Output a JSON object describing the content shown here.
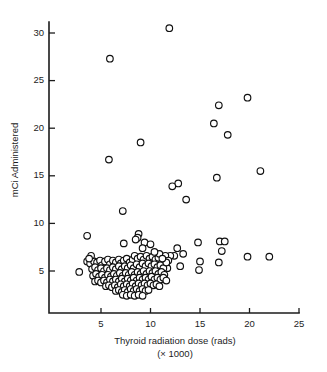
{
  "figure": {
    "background_color": "#ffffff",
    "ink_color": "#1c1c1c",
    "marker": {
      "shape": "open-circle",
      "fill_color": "#ffffff",
      "stroke_color": "#101010",
      "radius_px": 3.3
    }
  },
  "chart_data": {
    "type": "scatter",
    "title": "",
    "subtitle": "",
    "xlabel": "Thyroid radiation dose (rads)",
    "xlabel_line2": "(× 1000)",
    "ylabel": "mCi Administered",
    "xlim": [
      0,
      25
    ],
    "ylim": [
      0,
      32
    ],
    "xticks": [
      5,
      10,
      15,
      20,
      25
    ],
    "xtick_labels": [
      "5",
      "10",
      "15",
      "20",
      "25"
    ],
    "yticks": [
      5,
      10,
      15,
      20,
      25,
      30
    ],
    "ytick_labels": [
      "5",
      "10",
      "15",
      "20",
      "25",
      "30"
    ],
    "grid": false,
    "legend": false,
    "legend_position": "none",
    "series": [
      {
        "name": "patients",
        "marker": "open-circle",
        "points": [
          [
            11.9,
            30.5
          ],
          [
            5.9,
            27.3
          ],
          [
            19.8,
            23.2
          ],
          [
            16.9,
            22.4
          ],
          [
            16.4,
            20.5
          ],
          [
            17.8,
            19.3
          ],
          [
            9.0,
            18.5
          ],
          [
            5.8,
            16.7
          ],
          [
            21.1,
            15.5
          ],
          [
            16.7,
            14.8
          ],
          [
            12.8,
            14.2
          ],
          [
            12.2,
            13.9
          ],
          [
            13.6,
            12.5
          ],
          [
            7.2,
            11.3
          ],
          [
            3.6,
            8.7
          ],
          [
            8.8,
            8.9
          ],
          [
            8.7,
            8.5
          ],
          [
            8.5,
            8.3
          ],
          [
            9.4,
            8.0
          ],
          [
            14.8,
            8.0
          ],
          [
            17.0,
            8.1
          ],
          [
            17.5,
            8.1
          ],
          [
            7.3,
            7.9
          ],
          [
            10.0,
            7.8
          ],
          [
            9.2,
            7.4
          ],
          [
            12.7,
            7.4
          ],
          [
            17.2,
            7.1
          ],
          [
            13.3,
            6.8
          ],
          [
            12.4,
            6.6
          ],
          [
            12.0,
            6.6
          ],
          [
            11.5,
            6.6
          ],
          [
            19.8,
            6.5
          ],
          [
            22.0,
            6.5
          ],
          [
            15.0,
            6.0
          ],
          [
            16.9,
            5.9
          ],
          [
            13.0,
            5.5
          ],
          [
            14.9,
            5.1
          ],
          [
            11.7,
            5.3
          ],
          [
            2.8,
            4.9
          ],
          [
            3.6,
            6.0
          ],
          [
            3.9,
            5.8
          ],
          [
            4.3,
            6.0
          ],
          [
            4.6,
            5.9
          ],
          [
            4.9,
            6.1
          ],
          [
            5.1,
            5.6
          ],
          [
            5.4,
            6.0
          ],
          [
            5.7,
            6.2
          ],
          [
            5.9,
            5.7
          ],
          [
            6.2,
            6.1
          ],
          [
            6.5,
            5.9
          ],
          [
            6.8,
            6.2
          ],
          [
            7.0,
            5.8
          ],
          [
            7.3,
            6.1
          ],
          [
            7.6,
            6.3
          ],
          [
            7.9,
            5.9
          ],
          [
            8.2,
            6.2
          ],
          [
            8.4,
            6.6
          ],
          [
            8.7,
            6.3
          ],
          [
            9.0,
            6.5
          ],
          [
            9.3,
            6.2
          ],
          [
            9.6,
            6.6
          ],
          [
            9.9,
            6.3
          ],
          [
            10.2,
            6.5
          ],
          [
            10.5,
            6.2
          ],
          [
            10.8,
            6.4
          ],
          [
            4.1,
            5.2
          ],
          [
            4.4,
            5.4
          ],
          [
            4.7,
            5.1
          ],
          [
            5.0,
            5.3
          ],
          [
            5.3,
            5.0
          ],
          [
            5.6,
            5.3
          ],
          [
            5.9,
            5.1
          ],
          [
            6.2,
            5.4
          ],
          [
            6.5,
            5.2
          ],
          [
            6.8,
            5.5
          ],
          [
            7.1,
            5.2
          ],
          [
            7.4,
            5.5
          ],
          [
            7.7,
            5.3
          ],
          [
            8.0,
            5.6
          ],
          [
            8.3,
            5.3
          ],
          [
            8.6,
            5.7
          ],
          [
            8.9,
            5.4
          ],
          [
            9.2,
            5.8
          ],
          [
            9.5,
            5.5
          ],
          [
            9.8,
            5.8
          ],
          [
            10.1,
            5.5
          ],
          [
            10.4,
            5.7
          ],
          [
            10.7,
            5.4
          ],
          [
            11.0,
            5.6
          ],
          [
            11.3,
            5.3
          ],
          [
            4.2,
            4.5
          ],
          [
            4.5,
            4.7
          ],
          [
            4.8,
            4.4
          ],
          [
            5.1,
            4.6
          ],
          [
            5.4,
            4.3
          ],
          [
            5.7,
            4.6
          ],
          [
            6.0,
            4.4
          ],
          [
            6.3,
            4.7
          ],
          [
            6.6,
            4.5
          ],
          [
            6.9,
            4.8
          ],
          [
            7.2,
            4.5
          ],
          [
            7.5,
            4.8
          ],
          [
            7.8,
            4.6
          ],
          [
            8.1,
            4.9
          ],
          [
            8.4,
            4.6
          ],
          [
            8.7,
            4.9
          ],
          [
            9.0,
            4.7
          ],
          [
            9.3,
            5.0
          ],
          [
            9.6,
            4.7
          ],
          [
            9.9,
            5.0
          ],
          [
            10.2,
            4.8
          ],
          [
            10.5,
            5.0
          ],
          [
            10.8,
            4.7
          ],
          [
            11.1,
            4.9
          ],
          [
            11.4,
            4.6
          ],
          [
            4.4,
            3.9
          ],
          [
            4.7,
            4.0
          ],
          [
            5.0,
            3.8
          ],
          [
            5.3,
            4.0
          ],
          [
            5.6,
            3.8
          ],
          [
            5.9,
            4.1
          ],
          [
            6.2,
            3.9
          ],
          [
            6.5,
            4.1
          ],
          [
            6.8,
            3.9
          ],
          [
            7.1,
            4.2
          ],
          [
            7.4,
            3.9
          ],
          [
            7.7,
            4.2
          ],
          [
            8.0,
            4.0
          ],
          [
            8.3,
            4.3
          ],
          [
            8.6,
            4.0
          ],
          [
            8.9,
            4.3
          ],
          [
            9.2,
            4.1
          ],
          [
            9.5,
            4.3
          ],
          [
            9.8,
            4.1
          ],
          [
            10.1,
            4.4
          ],
          [
            10.4,
            4.1
          ],
          [
            10.7,
            4.3
          ],
          [
            11.0,
            4.1
          ],
          [
            11.3,
            4.3
          ],
          [
            11.6,
            4.0
          ],
          [
            5.5,
            3.4
          ],
          [
            5.8,
            3.5
          ],
          [
            6.1,
            3.3
          ],
          [
            6.4,
            3.5
          ],
          [
            6.7,
            3.3
          ],
          [
            7.0,
            3.6
          ],
          [
            7.3,
            3.4
          ],
          [
            7.6,
            3.6
          ],
          [
            7.9,
            3.4
          ],
          [
            8.2,
            3.7
          ],
          [
            8.5,
            3.4
          ],
          [
            8.8,
            3.7
          ],
          [
            9.1,
            3.5
          ],
          [
            9.4,
            3.7
          ],
          [
            9.7,
            3.5
          ],
          [
            10.0,
            3.7
          ],
          [
            10.3,
            3.5
          ],
          [
            10.6,
            3.6
          ],
          [
            10.9,
            3.4
          ],
          [
            6.5,
            2.9
          ],
          [
            6.8,
            3.0
          ],
          [
            7.1,
            2.8
          ],
          [
            7.4,
            3.0
          ],
          [
            7.7,
            2.8
          ],
          [
            8.0,
            3.1
          ],
          [
            8.3,
            2.9
          ],
          [
            8.6,
            3.1
          ],
          [
            8.9,
            2.9
          ],
          [
            9.2,
            3.1
          ],
          [
            9.5,
            2.9
          ],
          [
            9.8,
            3.0
          ],
          [
            7.2,
            2.5
          ],
          [
            7.6,
            2.4
          ],
          [
            8.0,
            2.5
          ],
          [
            8.4,
            2.4
          ],
          [
            8.8,
            2.5
          ],
          [
            9.2,
            2.4
          ],
          [
            4.0,
            6.6
          ],
          [
            3.8,
            6.3
          ],
          [
            11.8,
            6.1
          ],
          [
            11.6,
            5.9
          ],
          [
            10.9,
            6.8
          ],
          [
            10.4,
            7.0
          ],
          [
            11.2,
            6.3
          ]
        ]
      }
    ]
  }
}
